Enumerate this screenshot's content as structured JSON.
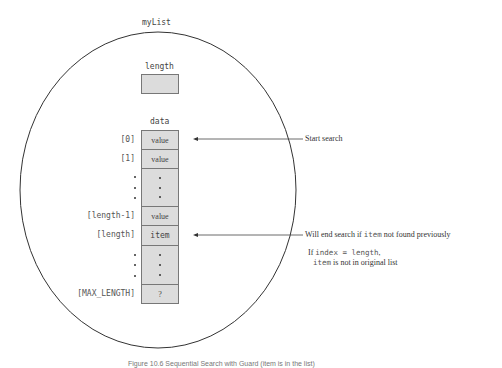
{
  "diagram": {
    "struct_name": "myList",
    "length_field": {
      "label": "length",
      "value": ""
    },
    "data_field": {
      "label": "data",
      "cells": [
        {
          "index": "[0]",
          "content": "value",
          "type": "cell"
        },
        {
          "index": "[1]",
          "content": "value",
          "type": "cell"
        },
        {
          "index": "",
          "content": "",
          "type": "ellipsis"
        },
        {
          "index": "[length-1]",
          "content": "value",
          "type": "cell"
        },
        {
          "index": "[length]",
          "content": "item",
          "type": "cell"
        },
        {
          "index": "",
          "content": "",
          "type": "ellipsis"
        },
        {
          "index": "[MAX_LENGTH]",
          "content": "?",
          "type": "cell"
        }
      ]
    },
    "annotations": {
      "start": {
        "text": "Start search",
        "points_to": "[0]"
      },
      "end": {
        "text_before": "Will end search if ",
        "code": "item",
        "text_after": " not found previously",
        "points_to": "[length]"
      },
      "note": {
        "line1_prefix": "If ",
        "line1_code": "index = length",
        "line1_suffix": ",",
        "line2_code": "item",
        "line2_text": " is not in original list"
      }
    },
    "colors": {
      "cell_fill": "#dcdcdc",
      "cell_border": "#777777",
      "outline": "#333333",
      "text": "#444444"
    }
  },
  "caption": "Figure 10.6   Sequential Search with Guard (item is in the list)"
}
